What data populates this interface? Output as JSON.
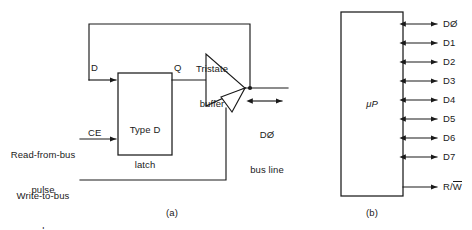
{
  "figure": {
    "panels": [
      {
        "key": "a",
        "caption": "(a)"
      },
      {
        "key": "b",
        "caption": "(b)"
      }
    ]
  },
  "panel_a": {
    "caption": "(a)",
    "latch": {
      "label_line1": "Type D",
      "label_line2": "latch",
      "input_d_label": "D",
      "input_ce_label": "CE",
      "output_q_label": "Q"
    },
    "tristate": {
      "label_line1": "Tristate",
      "label_line2": "buffer"
    },
    "signals": {
      "read_pulse_line1": "Read-from-bus",
      "read_pulse_line2": "pulse",
      "write_pulse_line1": "Write-to-bus",
      "write_pulse_line2": "pulse"
    },
    "bus": {
      "label_line1": "DØ",
      "label_line2": "bus line"
    }
  },
  "panel_b": {
    "caption": "(b)",
    "chip_label": "μP",
    "pins": [
      {
        "name": "DØ",
        "direction": "bidirectional"
      },
      {
        "name": "D1",
        "direction": "bidirectional"
      },
      {
        "name": "D2",
        "direction": "bidirectional"
      },
      {
        "name": "D3",
        "direction": "bidirectional"
      },
      {
        "name": "D4",
        "direction": "bidirectional"
      },
      {
        "name": "D5",
        "direction": "bidirectional"
      },
      {
        "name": "D6",
        "direction": "bidirectional"
      },
      {
        "name": "D7",
        "direction": "bidirectional"
      }
    ],
    "control_pin": {
      "name_prefix": "R/",
      "name_overlined": "W",
      "direction": "output"
    }
  },
  "colors": {
    "ink": "#1a1a1a",
    "background": "#ffffff"
  }
}
